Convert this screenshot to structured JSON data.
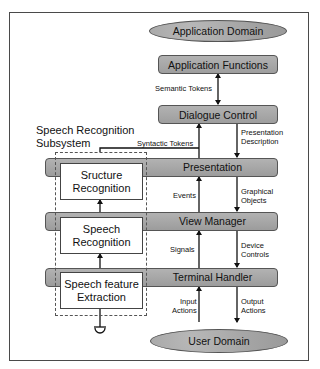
{
  "diagram": {
    "application_domain": "Application Domain",
    "application_functions": "Application Functions",
    "dialogue_control": "Dialogue Control",
    "presentation": "Presentation",
    "view_manager": "View Manager",
    "terminal_handler": "Terminal Handler",
    "user_domain": "User Domain",
    "subsystem": {
      "title_line1": "Speech Recognition",
      "title_line2": "Subsystem",
      "structure_recognition_line1": "Sructure",
      "structure_recognition_line2": "Recognition",
      "speech_recognition_line1": "Speech",
      "speech_recognition_line2": "Recognition",
      "feature_extraction_line1": "Speech feature",
      "feature_extraction_line2": "Extraction"
    },
    "edge_labels": {
      "semantic_tokens": "Semantic Tokens",
      "syntactic_tokens": "Syntactic Tokens",
      "presentation_description_line1": "Presentation",
      "presentation_description_line2": "Description",
      "events": "Events",
      "graphical_objects_line1": "Graphical",
      "graphical_objects_line2": "Objects",
      "signals": "Signals",
      "device_controls_line1": "Device",
      "device_controls_line2": "Controls",
      "input_actions_line1": "Input",
      "input_actions_line2": "Actions",
      "output_actions_line1": "Output",
      "output_actions_line2": "Actions"
    },
    "colors": {
      "box_fill": "#a6a6a6",
      "outline": "#555555",
      "frame": "#4a4a4a"
    }
  }
}
